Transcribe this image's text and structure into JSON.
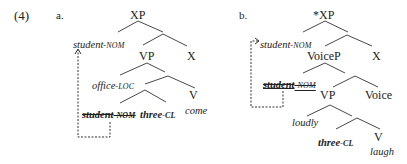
{
  "example_number": "(4)",
  "trees": [
    {
      "label": "a.",
      "root": "XP",
      "spec": {
        "stem": "student",
        "suffix": "-NOM"
      },
      "head_x": "X",
      "vp": "VP",
      "adjunct": {
        "stem": "office",
        "suffix": "-LOC"
      },
      "v": "V",
      "low_subject": {
        "stem": "student",
        "suffix": "-NOM"
      },
      "quantifier": {
        "stem": "three",
        "suffix": "-CL"
      },
      "verb": "come"
    },
    {
      "label": "b.",
      "root": "*XP",
      "spec": {
        "arrow": "->",
        "stem": "student",
        "suffix": "-NOM"
      },
      "head_x": "X",
      "voicep": "VoiceP",
      "voice_spec": {
        "stem": "student",
        "suffix": "-NOM"
      },
      "vp": "VP",
      "voice": "Voice",
      "adverb": "loudly",
      "quantifier": {
        "stem": "three",
        "suffix": "-CL"
      },
      "v": "V",
      "verb": "laugh"
    }
  ],
  "colors": {
    "ink": "#222222",
    "line": "#333333"
  }
}
